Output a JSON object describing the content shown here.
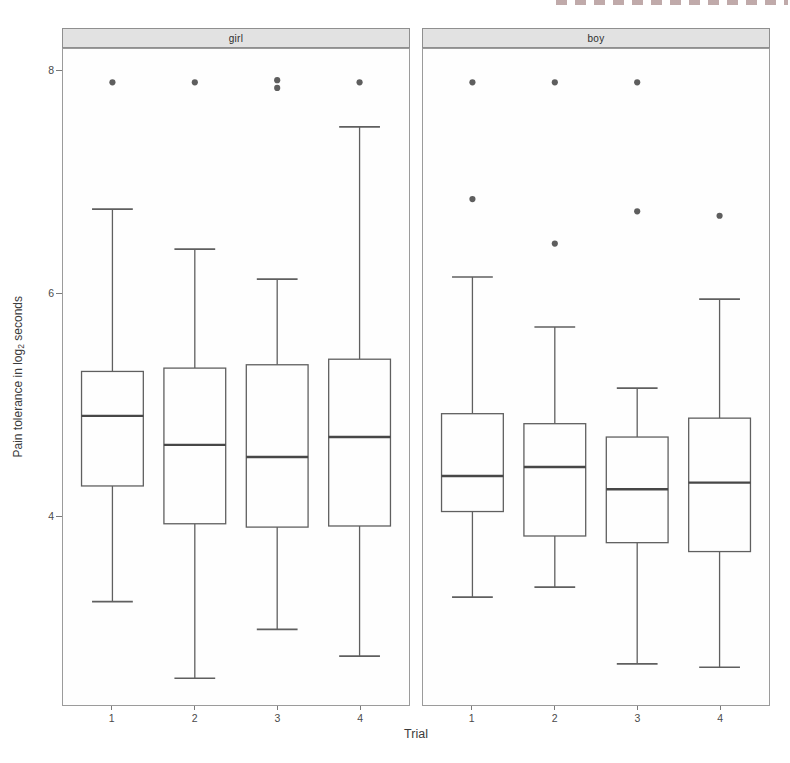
{
  "chart_data": {
    "type": "boxplot",
    "title": "",
    "facet_variable_values": [
      "girl",
      "boy"
    ],
    "x_axis": {
      "title": "Trial",
      "tick_labels": [
        "1",
        "2",
        "3",
        "4"
      ]
    },
    "y_axis": {
      "title_parts": {
        "prefix": "Pain tolerance in log",
        "sub": "2",
        "suffix": " seconds"
      },
      "ticks": [
        {
          "value": 8,
          "label": "8"
        },
        {
          "value": 6,
          "label": "6"
        },
        {
          "value": 4,
          "label": "4"
        }
      ],
      "range": [
        2.3,
        8.2
      ],
      "grid": "off"
    },
    "legend": "none",
    "facets": [
      {
        "label": "girl",
        "boxes": [
          {
            "trial": "1",
            "whisker_low": 3.23,
            "q1": 4.27,
            "median": 4.9,
            "q3": 5.3,
            "whisker_high": 6.76,
            "outliers": [
              7.9
            ]
          },
          {
            "trial": "2",
            "whisker_low": 2.54,
            "q1": 3.93,
            "median": 4.64,
            "q3": 5.33,
            "whisker_high": 6.4,
            "outliers": [
              7.9
            ]
          },
          {
            "trial": "3",
            "whisker_low": 2.98,
            "q1": 3.9,
            "median": 4.53,
            "q3": 5.36,
            "whisker_high": 6.13,
            "outliers": [
              7.92,
              7.85
            ]
          },
          {
            "trial": "4",
            "whisker_low": 2.74,
            "q1": 3.91,
            "median": 4.71,
            "q3": 5.41,
            "whisker_high": 7.5,
            "outliers": [
              7.9
            ]
          }
        ]
      },
      {
        "label": "boy",
        "boxes": [
          {
            "trial": "1",
            "whisker_low": 3.27,
            "q1": 4.04,
            "median": 4.36,
            "q3": 4.92,
            "whisker_high": 6.15,
            "outliers": [
              7.9,
              6.85
            ]
          },
          {
            "trial": "2",
            "whisker_low": 3.36,
            "q1": 3.82,
            "median": 4.44,
            "q3": 4.83,
            "whisker_high": 5.7,
            "outliers": [
              7.9,
              6.45
            ]
          },
          {
            "trial": "3",
            "whisker_low": 2.67,
            "q1": 3.76,
            "median": 4.24,
            "q3": 4.71,
            "whisker_high": 5.15,
            "outliers": [
              7.9,
              6.74
            ]
          },
          {
            "trial": "4",
            "whisker_low": 2.64,
            "q1": 3.68,
            "median": 4.3,
            "q3": 4.88,
            "whisker_high": 5.95,
            "outliers": [
              6.7
            ]
          }
        ]
      }
    ],
    "style": {
      "box_stroke": "#5f5f5f",
      "median_stroke": "#474747",
      "outlier_fill": "#5e5e5e",
      "box_fill": "#fefefe",
      "strip_bg": "#e2e2e2",
      "strip_border": "#8f8f8f",
      "panel_border": "#9b9b9b",
      "axis_text": "#4a4a4a",
      "remnant_tint": "#8c6464"
    }
  }
}
